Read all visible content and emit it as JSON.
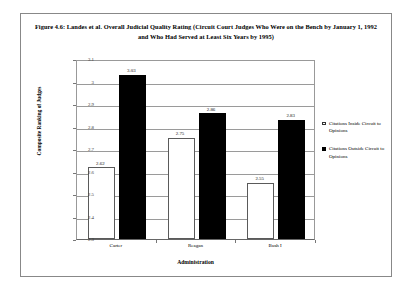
{
  "figure": {
    "title": "Figure 4.6: Landes et al. Overall Judicial Quality Rating (Circuit Court Judges Who Were on the Bench by January 1, 1992 and Who Had Served at Least Six Years by 1995)"
  },
  "chart_data": {
    "type": "bar",
    "title": "Figure 4.6: Landes et al. Overall Judicial Quality Rating (Circuit Court Judges Who Were on the Bench by January 1, 1992 and Who Had Served at Least Six Years by 1995)",
    "xlabel": "Administration",
    "ylabel": "Composite Ranking of Judges",
    "categories": [
      "Carter",
      "Reagan",
      "Bush I"
    ],
    "series": [
      {
        "name": "Citations Inside Circuit to Opinions",
        "color": "#ffffff",
        "values": [
          2.62,
          2.75,
          2.55
        ],
        "labels": [
          "2.62",
          "2.75",
          "2.55"
        ]
      },
      {
        "name": "Citations Outside Circuit to Opinions",
        "color": "#000000",
        "values": [
          3.03,
          2.86,
          2.83
        ],
        "labels": [
          "3.03",
          "2.86",
          "2.83"
        ]
      }
    ],
    "ylim": [
      2.3,
      3.1
    ],
    "yticks": [
      3.1,
      3,
      2.9,
      2.8,
      2.7,
      2.6,
      2.5,
      2.4,
      2.3
    ],
    "ytick_labels": [
      "3.1",
      "3",
      "2.9",
      "2.8",
      "2.7",
      "2.6",
      "2.5",
      "2.4",
      "2.3"
    ],
    "grid": true,
    "legend_position": "right"
  },
  "legend": {
    "entries": [
      {
        "label": "Citations Inside Circuit to Opinions"
      },
      {
        "label": "Citations Outside Circuit to Opinions"
      }
    ]
  }
}
